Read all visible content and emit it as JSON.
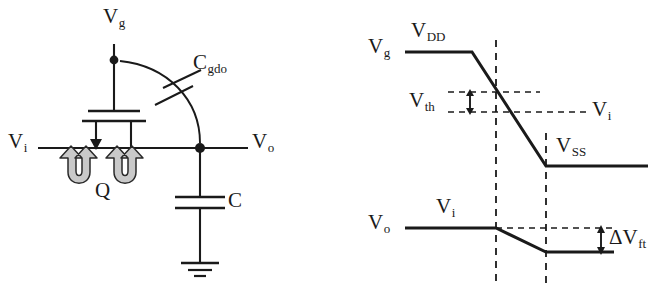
{
  "figure": {
    "type": "schematic-and-timing-diagram",
    "line_color": "#1a1a1a",
    "background": "#ffffff"
  },
  "circuit": {
    "labels": {
      "gate_node": {
        "base": "V",
        "sub": "g"
      },
      "input_node": {
        "base": "V",
        "sub": "i"
      },
      "output_node": {
        "base": "V",
        "sub": "o"
      },
      "overlap_cap": {
        "base": "C",
        "sub": "gdo"
      },
      "load_cap": {
        "base": "C",
        "sub": ""
      },
      "charge": {
        "base": "Q",
        "sub": ""
      }
    },
    "elements": [
      {
        "name": "gate-terminal-wire",
        "kind": "wire"
      },
      {
        "name": "gate-node-dot",
        "kind": "junction"
      },
      {
        "name": "mosfet-gate-plate",
        "kind": "device"
      },
      {
        "name": "mosfet-channel-bar",
        "kind": "device"
      },
      {
        "name": "mosfet-source-arrow",
        "kind": "device"
      },
      {
        "name": "mosfet-drain-lead",
        "kind": "device"
      },
      {
        "name": "input-wire",
        "kind": "wire"
      },
      {
        "name": "output-wire",
        "kind": "wire"
      },
      {
        "name": "output-node-dot",
        "kind": "junction"
      },
      {
        "name": "overlap-capacitor-arc",
        "kind": "device"
      },
      {
        "name": "load-capacitor",
        "kind": "device"
      },
      {
        "name": "ground-symbol",
        "kind": "device"
      },
      {
        "name": "charge-arrow-left",
        "kind": "annotation"
      },
      {
        "name": "charge-arrow-right",
        "kind": "annotation"
      }
    ]
  },
  "waveform": {
    "traces": [
      {
        "name": "gate-voltage-trace",
        "signal": {
          "base": "V",
          "sub": "g"
        },
        "high_level_label": {
          "base": "V",
          "sub": "DD"
        },
        "low_level_label": {
          "base": "V",
          "sub": "SS"
        },
        "shape": "high-then-falling-ramp-then-low"
      },
      {
        "name": "output-voltage-trace",
        "signal": {
          "base": "V",
          "sub": "o"
        },
        "high_level_label": {
          "base": "V",
          "sub": "i"
        },
        "shape": "flat-then-small-falling-step"
      }
    ],
    "annotations": [
      {
        "name": "threshold-voltage-marker",
        "base": "V",
        "sub": "th",
        "style": "double-headed-vertical-arrow-between-dashed-lines"
      },
      {
        "name": "input-level-marker",
        "base": "V",
        "sub": "i",
        "style": "horizontal-dashed-reference-line"
      },
      {
        "name": "feedthrough-marker",
        "base": "ΔV",
        "sub": "ft",
        "style": "double-headed-vertical-arrow"
      }
    ],
    "guides": [
      {
        "name": "vertical-dash-conduction-start",
        "style": "dashed"
      },
      {
        "name": "vertical-dash-conduction-end",
        "style": "dashed"
      }
    ]
  }
}
